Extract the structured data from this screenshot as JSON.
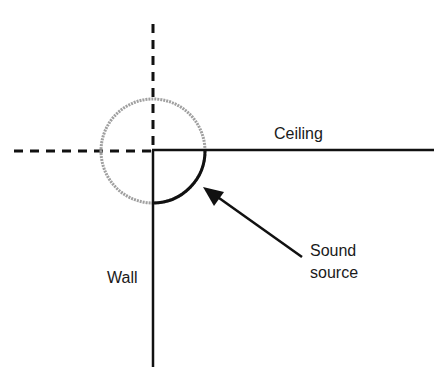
{
  "diagram": {
    "labels": {
      "ceiling": "Ceiling",
      "wall": "Wall",
      "source_line1": "Sound",
      "source_line2": "source"
    },
    "elements": {
      "dashed_vertical_axis": {
        "x": 153,
        "y1": 24,
        "y2": 151
      },
      "dashed_horizontal_axis": {
        "y": 151,
        "x1": 14,
        "x2": 153
      },
      "ceiling_line": {
        "y": 150,
        "x1": 153,
        "x2": 434
      },
      "wall_line": {
        "x": 153,
        "y1": 150,
        "y2": 367
      },
      "circle": {
        "cx": 153,
        "cy": 151,
        "r": 52,
        "style": "gray dotted (image)"
      },
      "quarter_arc": {
        "description": "solid black quarter arc in the ceiling-wall corner (real source region)"
      },
      "arrow": {
        "from": [
          302,
          257
        ],
        "to": [
          204,
          187
        ],
        "points_to": "quarter arc"
      }
    },
    "colors": {
      "line": "#111111",
      "circle": "#9a9a9a",
      "text": "#1a1a1a"
    }
  }
}
